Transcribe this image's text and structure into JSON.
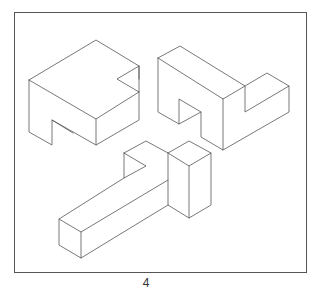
{
  "figure": {
    "page_number": "4",
    "colors": {
      "line": "#555555",
      "background": "#ffffff"
    },
    "shapes": [
      {
        "name": "notched-block"
      },
      {
        "name": "stepped-block"
      },
      {
        "name": "t-beam-block"
      }
    ]
  }
}
